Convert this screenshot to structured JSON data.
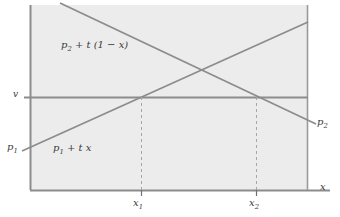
{
  "figure": {
    "type": "line-diagram",
    "background_color": "#ffffff",
    "plot_fill_color": "#ececec",
    "line_color": "#7a7a7a",
    "text_color": "#3a3a3a",
    "plot_area": {
      "left": 30,
      "top": 5,
      "right": 308,
      "bottom": 190
    }
  },
  "axes": {
    "x_axis_label": "x",
    "y_axis_value_label": "v",
    "y_intercept_label": "p",
    "y_intercept_sub": "1",
    "x_ticks": [
      {
        "label": "x",
        "sub": "1",
        "position_px": 141
      },
      {
        "label": "x",
        "sub": "2",
        "position_px": 256
      }
    ]
  },
  "curves": [
    {
      "name": "upper-falling-line",
      "label_base": "p",
      "label_sub": "2",
      "label_rest": " + t (1 − x)",
      "label_full": "p₂ + t (1 − x)",
      "direction": "decreasing",
      "start": {
        "x": 60,
        "y": 5
      },
      "end": {
        "x": 308,
        "y": 123
      },
      "right_end_label_base": "p",
      "right_end_label_sub": "2"
    },
    {
      "name": "lower-rising-line",
      "label_base": "p",
      "label_sub": "1",
      "label_rest": " + t x",
      "label_full": "p₁ + t x",
      "direction": "increasing",
      "start": {
        "x": 30,
        "y": 150
      },
      "end": {
        "x": 308,
        "y": 22
      }
    },
    {
      "name": "horizontal-v-line",
      "label": "v",
      "y_px": 97,
      "x_from": 24,
      "x_to": 308
    }
  ],
  "intersections": [
    {
      "name": "x1-intersection",
      "x_px": 141,
      "y_px": 97,
      "tick_label": "x₁"
    },
    {
      "name": "x2-intersection",
      "x_px": 256,
      "y_px": 97,
      "tick_label": "x₂"
    }
  ],
  "labels": {
    "v": "v",
    "p1_left": "p",
    "p1_left_sub": "1",
    "p2_right": "p",
    "p2_right_sub": "2",
    "x_axis": "x",
    "upper_curve_base": "p",
    "upper_curve_sub": "2",
    "upper_curve_rest": " + t (1 − x)",
    "lower_curve_base": "p",
    "lower_curve_sub": "1",
    "lower_curve_rest": " + t x",
    "tick1_base": "x",
    "tick1_sub": "1",
    "tick2_base": "x",
    "tick2_sub": "2"
  }
}
